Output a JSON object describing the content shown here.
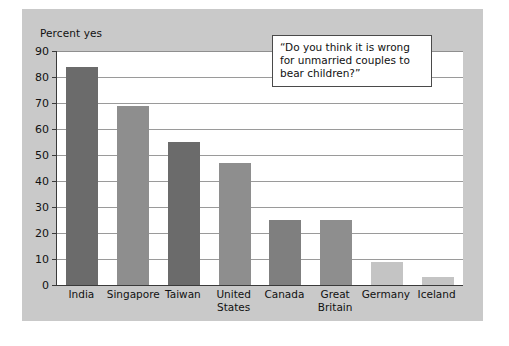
{
  "figure": {
    "panel_color": "#c9c9c9",
    "plot_background": "#ffffff",
    "axis_color": "#3a3a3a",
    "grid_color": "#9a9a9a"
  },
  "callout": {
    "text": "“Do you think it is wrong for unmarried couples to bear children?”"
  },
  "chart_data": {
    "type": "bar",
    "title": "",
    "xlabel": "",
    "ylabel": "Percent yes",
    "ylim": [
      0,
      90
    ],
    "yticks": [
      0,
      10,
      20,
      30,
      40,
      50,
      60,
      70,
      80,
      90
    ],
    "ytick_labels": [
      "0",
      "10",
      "20",
      "30",
      "40",
      "50",
      "60",
      "70",
      "80",
      "90"
    ],
    "grid": true,
    "legend": false,
    "annotation": "“Do you think it is wrong for unmarried couples to bear children?”",
    "categories": [
      "India",
      "Singapore",
      "Taiwan",
      "United States",
      "Canada",
      "Great Britain",
      "Germany",
      "Iceland"
    ],
    "category_labels": [
      "India",
      "Singapore",
      "Taiwan",
      "United\nStates",
      "Canada",
      "Great\nBritain",
      "Germany",
      "Iceland"
    ],
    "values": [
      84,
      69,
      55,
      47,
      25,
      25,
      9,
      3
    ],
    "bar_colors": [
      "#6b6b6b",
      "#8e8e8e",
      "#6b6b6b",
      "#8e8e8e",
      "#7f7f7f",
      "#8e8e8e",
      "#c4c4c4",
      "#c4c4c4"
    ]
  }
}
